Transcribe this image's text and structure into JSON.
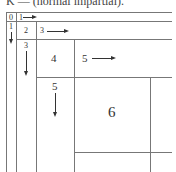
{
  "caption": "K — (normal impartial).",
  "cells": {
    "c0": "0",
    "c1_row": "1",
    "c1_col": "1",
    "c2": "2",
    "c3_row": "3",
    "c3_col": "3",
    "c4": "4",
    "c5_row": "5",
    "c5_col": "5",
    "c6": "6"
  },
  "colors": {
    "line": "#777777",
    "text": "#333333"
  }
}
